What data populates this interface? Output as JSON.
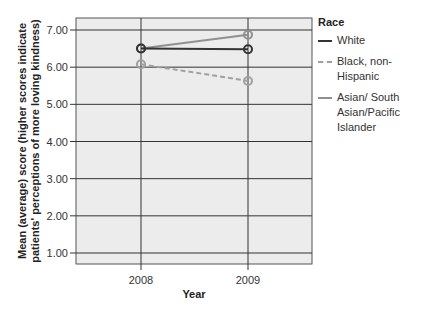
{
  "chart_data": {
    "type": "line",
    "title": "",
    "xlabel": "Year",
    "ylabel": "Mean (average) score (higher scores indicate patients' perceptions of more loving kindness)",
    "ylabel_lines": [
      "Mean (average) score (higher scores indicate",
      "patients' perceptions of more loving kindness)"
    ],
    "categories": [
      "2008",
      "2009"
    ],
    "ylim": [
      0.7,
      7.3
    ],
    "yticks": [
      "1.00",
      "2.00",
      "3.00",
      "4.00",
      "5.00",
      "6.00",
      "7.00"
    ],
    "grid": true,
    "legend_position": "right",
    "legend_title": "Race",
    "series": [
      {
        "name": "White",
        "values": [
          6.5,
          6.48
        ],
        "color": "#333333",
        "dash": "solid"
      },
      {
        "name": "Black, non-Hispanic",
        "values": [
          6.08,
          5.63
        ],
        "color": "#a0a0a0",
        "dash": "dashed"
      },
      {
        "name": "Asian/ South Asian/Pacific Islander",
        "values": [
          6.5,
          6.87
        ],
        "color": "#909090",
        "dash": "solid"
      }
    ]
  },
  "legend": {
    "title": "Race",
    "items": [
      {
        "label": "White"
      },
      {
        "label": "Black, non-Hispanic"
      },
      {
        "label": "Asian/ South Asian/Pacific Islander"
      }
    ]
  }
}
